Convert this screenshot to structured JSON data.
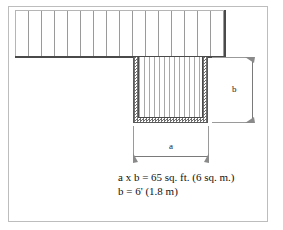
{
  "figure": {
    "type": "architectural-plan-diagram",
    "caption_lines": [
      "a x b = 65 sq. ft. (6 sq. m.)",
      "b = 6' (1.8 m)"
    ],
    "dimensions": [
      {
        "id": "a",
        "label": "a",
        "orientation": "horizontal",
        "position": "below-opening"
      },
      {
        "id": "b",
        "label": "b",
        "orientation": "vertical",
        "position": "right-of-opening"
      }
    ],
    "regions": [
      {
        "name": "upper-floor-band",
        "fill": "vertical-hatch",
        "description": "floor framing joists above"
      },
      {
        "name": "stair-opening",
        "fill": "vertical-hatch",
        "description": "stair well opening"
      },
      {
        "name": "opening-wall",
        "fill": "stipple-hatch",
        "description": "framed wall around opening"
      }
    ],
    "colors": {
      "line_dark": "#4a4a4a",
      "line_mid": "#7a7a7a",
      "hatch": "#9a9a9a",
      "frame": "#bdbdbd",
      "text": "#111111",
      "background": "#ffffff"
    }
  }
}
